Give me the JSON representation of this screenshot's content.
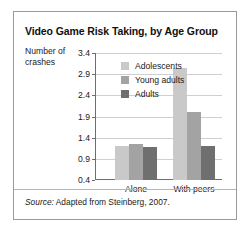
{
  "figure": {
    "title": "Video Game Risk Taking, by Age Group",
    "y_axis_label": "Number of crashes",
    "source_lead": "Source:",
    "source_text": " Adapted from Steinberg, 2007."
  },
  "legend": {
    "position": "top-left-inside",
    "entries": [
      {
        "label": "Adolescents",
        "color": "#c9c9c9"
      },
      {
        "label": "Young adults",
        "color": "#a3a3a3"
      },
      {
        "label": "Adults",
        "color": "#6f6f6f"
      }
    ]
  },
  "chart_data": {
    "type": "bar",
    "title": "Video Game Risk Taking, by Age Group",
    "xlabel": "",
    "ylabel": "Number of crashes",
    "categories": [
      "Alone",
      "With peers"
    ],
    "series": [
      {
        "name": "Adolescents",
        "color": "#c9c9c9",
        "values": [
          1.2,
          3.05
        ]
      },
      {
        "name": "Young adults",
        "color": "#a3a3a3",
        "values": [
          1.25,
          2.0
        ]
      },
      {
        "name": "Adults",
        "color": "#6f6f6f",
        "values": [
          1.18,
          1.2
        ]
      }
    ],
    "ylim": [
      0.4,
      3.4
    ],
    "yticks": [
      "3.4",
      "2.9",
      "2.4",
      "1.9",
      "1.4",
      "0.9",
      "0.4"
    ],
    "ytick_values": [
      3.4,
      2.9,
      2.4,
      1.9,
      1.4,
      0.9,
      0.4
    ],
    "grid": true,
    "legend": [
      "Adolescents",
      "Young adults",
      "Adults"
    ]
  }
}
